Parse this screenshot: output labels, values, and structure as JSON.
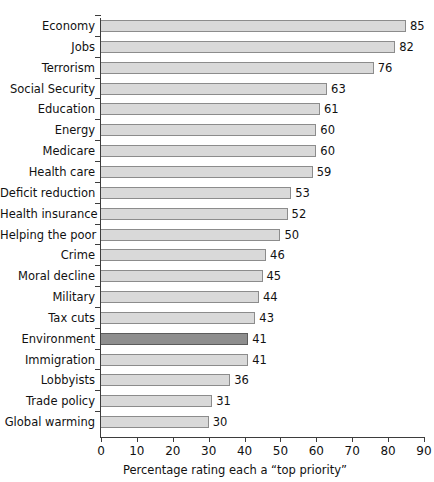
{
  "chart_data": {
    "type": "bar",
    "orientation": "horizontal",
    "title": "",
    "xlabel": "Percentage rating each a “top priority”",
    "ylabel": "",
    "xlim": [
      0,
      90
    ],
    "xticks": [
      0,
      10,
      20,
      30,
      40,
      50,
      60,
      70,
      80,
      90
    ],
    "grid": false,
    "legend": null,
    "highlight_category": "Environment",
    "colors": {
      "bar_fill": "#d9d9d9",
      "bar_border": "#8c8c8c",
      "highlight_fill": "#8e8e8e",
      "highlight_border": "#5c5c5c",
      "axis": "#3d3d3d",
      "text": "#111111",
      "background": "#ffffff"
    },
    "categories": [
      "Economy",
      "Jobs",
      "Terrorism",
      "Social Security",
      "Education",
      "Energy",
      "Medicare",
      "Health care",
      "Deficit reduction",
      "Health insurance",
      "Helping the poor",
      "Crime",
      "Moral decline",
      "Military",
      "Tax cuts",
      "Environment",
      "Immigration",
      "Lobbyists",
      "Trade policy",
      "Global warming"
    ],
    "values": [
      85,
      82,
      76,
      63,
      61,
      60,
      60,
      59,
      53,
      52,
      50,
      46,
      45,
      44,
      43,
      41,
      41,
      36,
      31,
      30
    ]
  }
}
